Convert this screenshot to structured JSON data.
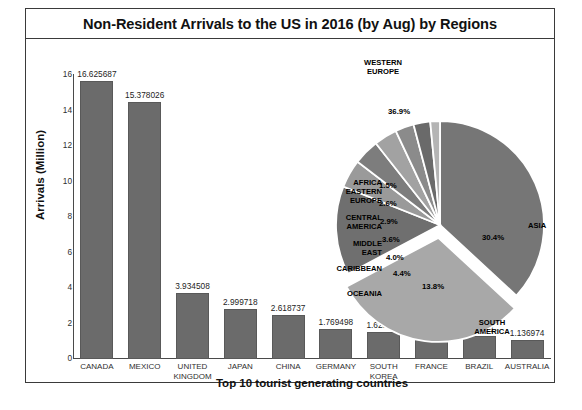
{
  "chart_title": "Non-Resident Arrivals to the US in 2016 (by Aug) by Regions",
  "bar_axis": {
    "ylabel": "Arrivals (Million)",
    "xlabel": "Top 10 tourist generating countries",
    "yticks": [
      "16",
      "14",
      "12",
      "10",
      "8",
      "6",
      "4",
      "2",
      "0"
    ]
  },
  "chart_data": [
    {
      "type": "bar",
      "title": "Non-Resident Arrivals to the US in 2016 (by Aug) by Regions",
      "xlabel": "Top 10 tourist generating countries",
      "ylabel": "Arrivals (Million)",
      "ylim": [
        0,
        17
      ],
      "yticks": [
        0,
        2,
        4,
        6,
        8,
        10,
        12,
        14,
        16
      ],
      "grid": false,
      "categories": [
        "CANADA",
        "MEXICO",
        "UNITED KINGDOM",
        "JAPAN",
        "CHINA",
        "GERMANY",
        "SOUTH KOREA",
        "FRANCE",
        "BRAZIL",
        "AUSTRALIA"
      ],
      "values": [
        16.625687,
        15.378026,
        3.934508,
        2.999718,
        2.618737,
        1.769498,
        1.628563,
        1.419409,
        1.39371,
        1.136974
      ],
      "value_labels": [
        "16.625687",
        "15.378026",
        "3.934508",
        "2.999718",
        "2.618737",
        "1.769498",
        "1.628563",
        "1.419409",
        "1.39371",
        "1.136974"
      ]
    },
    {
      "type": "pie",
      "title": "",
      "legend": "labels-outside",
      "labels": [
        "WESTERN EUROPE",
        "ASIA",
        "SOUTH AMERICA",
        "OCEANIA",
        "CARIBBEAN",
        "MIDDLE EAST",
        "CENTRAL AMERICA",
        "EASTERN EUROPE",
        "AFRICA"
      ],
      "values": [
        36.9,
        30.4,
        13.8,
        4.4,
        4.0,
        3.6,
        2.9,
        2.6,
        1.5
      ],
      "value_labels": [
        "36.9%",
        "30.4%",
        "13.8%",
        "4.4%",
        "4.0%",
        "3.6%",
        "2.9%",
        "2.6%",
        "1.5%"
      ],
      "exploded": [
        "ASIA"
      ]
    }
  ],
  "bars": [
    {
      "category_line1": "CANADA",
      "category_line2": "",
      "value_label": "16.625687"
    },
    {
      "category_line1": "MEXICO",
      "category_line2": "",
      "value_label": "15.378026"
    },
    {
      "category_line1": "UNITED",
      "category_line2": "KINGDOM",
      "value_label": "3.934508"
    },
    {
      "category_line1": "JAPAN",
      "category_line2": "",
      "value_label": "2.999718"
    },
    {
      "category_line1": "CHINA",
      "category_line2": "",
      "value_label": "2.618737"
    },
    {
      "category_line1": "GERMANY",
      "category_line2": "",
      "value_label": "1.769498"
    },
    {
      "category_line1": "SOUTH",
      "category_line2": "KOREA",
      "value_label": "1.628563"
    },
    {
      "category_line1": "FRANCE",
      "category_line2": "",
      "value_label": "1.419409"
    },
    {
      "category_line1": "BRAZIL",
      "category_line2": "",
      "value_label": "1.39371"
    },
    {
      "category_line1": "AUSTRALIA",
      "category_line2": "",
      "value_label": "1.136974"
    }
  ],
  "pie_labels": {
    "western_europe_l1": "WESTERN",
    "western_europe_l2": "EUROPE",
    "asia": "ASIA",
    "south_america_l1": "SOUTH",
    "south_america_l2": "AMERICA",
    "oceania": "OCEANIA",
    "caribbean": "CARIBBEAN",
    "middle_east_l1": "MIDDLE",
    "middle_east_l2": "EAST",
    "central_america_l1": "CENTRAL",
    "central_america_l2": "AMERICA",
    "eastern_europe_l1": "EASTERN",
    "eastern_europe_l2": "EUROPE",
    "africa": "AFRICA"
  },
  "pie_pct": {
    "western_europe": "36.9%",
    "asia": "30.4%",
    "south_america": "13.8%",
    "oceania": "4.4%",
    "caribbean": "4.0%",
    "middle_east": "3.6%",
    "central_america": "2.9%",
    "eastern_europe": "2.6%",
    "africa": "1.5%"
  },
  "colors": {
    "bar_fill": "#6b6b6b",
    "frame": "#3a3a3a",
    "pie_western_europe": "#767676",
    "pie_asia": "#a8a8a8",
    "pie_south_america": "#6f6f6f",
    "pie_oceania": "#9a9a9a",
    "pie_caribbean": "#7d7d7d",
    "pie_middle_east": "#a2a2a2",
    "pie_central_america": "#8b8b8b",
    "pie_eastern_europe": "#6a6a6a",
    "pie_africa": "#b4b4b4"
  }
}
